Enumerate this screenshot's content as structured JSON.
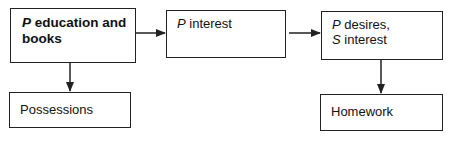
{
  "diagram": {
    "type": "flowchart",
    "nodes": [
      {
        "id": "b1",
        "italic_prefix": "P",
        "text": " education and books",
        "bold": true
      },
      {
        "id": "b2",
        "italic_prefix": "P",
        "text": " interest",
        "bold": false
      },
      {
        "id": "b3",
        "line1_prefix": "P",
        "line1": " desires,",
        "line2_prefix": "S",
        "line2": " interest",
        "bold": false
      },
      {
        "id": "b4",
        "text": "Possessions",
        "bold": false
      },
      {
        "id": "b5",
        "text": "Homework",
        "bold": false
      }
    ],
    "edges": [
      {
        "from": "b1",
        "to": "b2",
        "direction": "right"
      },
      {
        "from": "b2",
        "to": "b3",
        "direction": "right"
      },
      {
        "from": "b1",
        "to": "b4",
        "direction": "down"
      },
      {
        "from": "b3",
        "to": "b5",
        "direction": "down"
      }
    ],
    "colors": {
      "line": "#222222",
      "background": "#ffffff"
    }
  }
}
